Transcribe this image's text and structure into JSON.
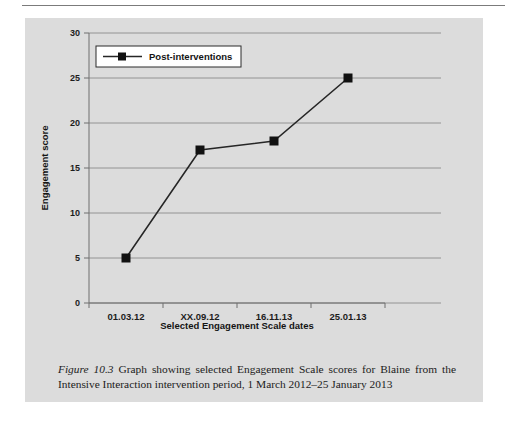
{
  "figure": {
    "label": "Figure 10.3",
    "caption": "Graph showing selected Engagement Scale scores for Blaine from the Intensive Interaction intervention period, 1 March 2012–25 January 2013"
  },
  "colors": {
    "panel_background": "#dcdcdc",
    "page_background": "#ffffff",
    "gridline": "#8a8a8a",
    "axis_line": "#6f6f6f",
    "series_line": "#262626",
    "marker_fill": "#111111",
    "legend_background": "#ffffff",
    "legend_border": "#2b2b2b",
    "text": "#1c1c1c",
    "top_rule": "#7b7b7b"
  },
  "legend": {
    "position": "top-left-inside",
    "entries": [
      {
        "name": "Post-interventions",
        "marker": "square",
        "line": "solid"
      }
    ]
  },
  "chart_data": {
    "type": "line",
    "title": "",
    "xlabel": "Selected Engagement Scale dates",
    "ylabel": "Engagement score",
    "categories": [
      "01.03.12",
      "XX.09.12",
      "16.11.13",
      "25.01.13"
    ],
    "yticks": [
      0,
      5,
      10,
      15,
      20,
      25,
      30
    ],
    "ylim": [
      0,
      30
    ],
    "grid": true,
    "legend": [
      "Post-interventions"
    ],
    "series": [
      {
        "name": "Post-interventions",
        "values": [
          5,
          17,
          18,
          25
        ]
      }
    ]
  }
}
